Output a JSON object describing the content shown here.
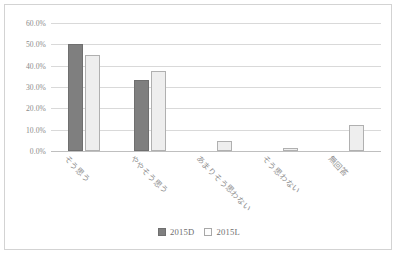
{
  "chart_data": {
    "type": "bar",
    "title": "",
    "xlabel": "",
    "ylabel": "",
    "categories": [
      "そう思う",
      "ややそう思う",
      "あまりそう思わない",
      "そう思わない",
      "無回答"
    ],
    "series": [
      {
        "name": "2015D",
        "color": "#7f7f7f",
        "values": [
          50.0,
          33.3,
          0.0,
          0.0,
          0.0
        ]
      },
      {
        "name": "2015L",
        "color": "#eeeeee",
        "values": [
          45.2,
          37.5,
          4.5,
          1.4,
          12.0
        ]
      }
    ],
    "ylim": [
      0,
      60
    ],
    "ytick_labels": [
      "0.0%",
      "10.0%",
      "20.0%",
      "30.0%",
      "40.0%",
      "50.0%",
      "60.0%"
    ],
    "ytick_values": [
      0,
      10,
      20,
      30,
      40,
      50,
      60
    ],
    "grid": true,
    "legend_position": "bottom"
  },
  "legend": {
    "items": [
      {
        "label": "2015D"
      },
      {
        "label": "2015L"
      }
    ]
  }
}
